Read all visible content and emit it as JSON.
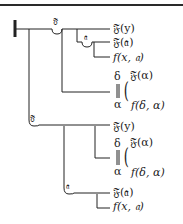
{
  "diagram": {
    "type": "Frege Begriffsschrift formula",
    "concavities": {
      "top_main": "𝔉",
      "top_inner": "𝔞",
      "lower_main": "𝔉",
      "lower_inner": "𝔞"
    },
    "upper_block": {
      "leaf1": "𝔉(y)",
      "leaf2": "𝔉(𝔞)",
      "leaf3": "f(x, 𝔞)",
      "delta": "δ",
      "alpha": "α",
      "bracket": "(",
      "leaf4": "𝔉(α)",
      "leaf5": "f(δ, α)"
    },
    "lower_block": {
      "leaf1": "𝔉(y)",
      "delta": "δ",
      "alpha": "α",
      "bracket": "(",
      "leaf2": "𝔉(α)",
      "leaf3": "f(δ, α)",
      "leaf4": "𝔉(𝔞)",
      "leaf5": "f(x, 𝔞)"
    }
  }
}
